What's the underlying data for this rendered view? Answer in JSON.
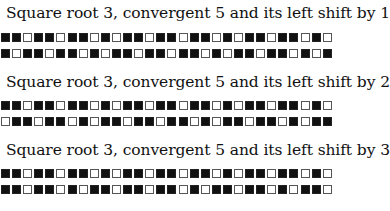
{
  "figures": [
    {
      "caption": "Square root 3, convergent 5 and its left shift by 1",
      "rows": [
        "BBWBBWBBWBWBBWBBWBBWBWBBWBBWBW",
        "BWBBWBBWBWBBWBBWBBWBWBBWBBWBWB"
      ]
    },
    {
      "caption": "Square root 3, convergent 5 and its left shift by 2",
      "rows": [
        "BBWBBWBBWBWBBWBBWBBWBWBBWBBWBW",
        "WBBWBBWBWBBWBBWBBWBWBBWBBWBWBB"
      ]
    },
    {
      "caption": "Square root 3, convergent 5 and its left shift by 3",
      "rows": [
        "BBWBBWBBWBWBBWBBWBBWBWBBWBBWBW",
        "BBWBBWBWBBWBBWBBWBWBBWBBWBWBBW"
      ]
    }
  ]
}
